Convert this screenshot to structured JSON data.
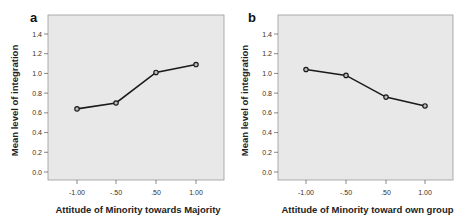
{
  "chart_data": [
    {
      "type": "line",
      "panel_label": "a",
      "title": "",
      "xlabel": "Attitude of Minority towards Majority",
      "ylabel": "Mean level of integration",
      "categories": [
        "-1.00",
        "-.50",
        ".50",
        "1.00"
      ],
      "x": [
        -1.0,
        -0.5,
        0.5,
        1.0
      ],
      "values": [
        0.64,
        0.7,
        1.01,
        1.09
      ],
      "yticks": [
        "0.0",
        "0.2",
        "0.4",
        "0.6",
        "0.8",
        "1.0",
        "1.2",
        "1.4"
      ],
      "ylim": [
        0.0,
        1.4
      ],
      "grid": false,
      "background": "#e8e8e8",
      "line_color": "#1a1a1a"
    },
    {
      "type": "line",
      "panel_label": "b",
      "title": "",
      "xlabel": "Attitude of Minority toward own group",
      "ylabel": "Mean level of integration",
      "categories": [
        "-1.00",
        "-.50",
        ".50",
        "1.00"
      ],
      "x": [
        -1.0,
        -0.5,
        0.5,
        1.0
      ],
      "values": [
        1.04,
        0.98,
        0.76,
        0.67
      ],
      "yticks": [
        "0.0",
        "0.2",
        "0.4",
        "0.6",
        "0.8",
        "1.0",
        "1.2",
        "1.4"
      ],
      "ylim": [
        0.0,
        1.4
      ],
      "grid": false,
      "background": "#e8e8e8",
      "line_color": "#1a1a1a"
    }
  ]
}
